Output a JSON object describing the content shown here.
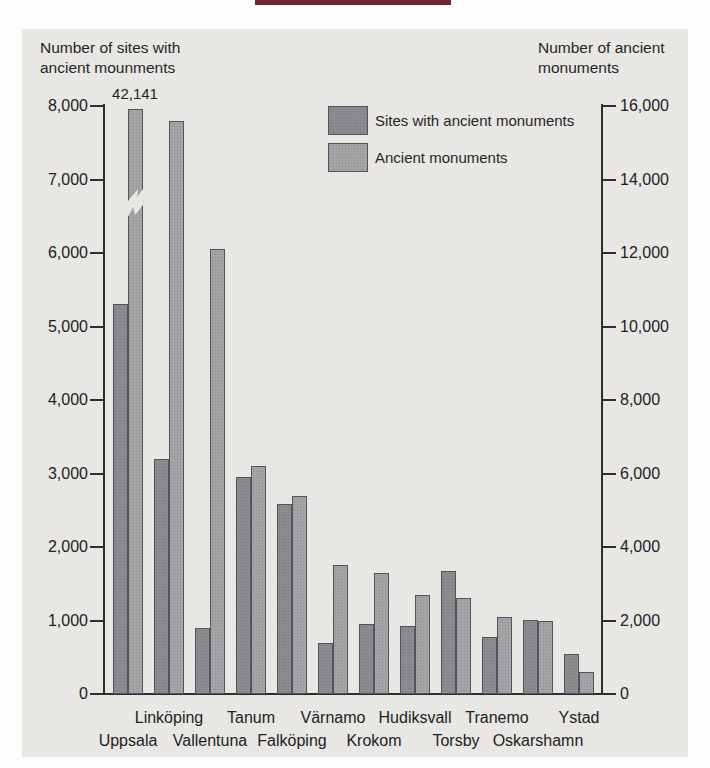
{
  "page": {
    "heading_remnant_color": "#702731",
    "panel_color": "#e8e7e4",
    "text_color": "#262626"
  },
  "titles": {
    "left_line1": "Number of sites with",
    "left_line2": "ancient mounments",
    "right_line1": "Number of ancient",
    "right_line2": "monuments"
  },
  "legend": {
    "items": [
      {
        "label": "Sites with ancient monuments",
        "color": "#8c8b90"
      },
      {
        "label": "Ancient monuments",
        "color": "#a5a3a6"
      }
    ]
  },
  "chart_data": {
    "type": "bar",
    "categories": [
      "Uppsala",
      "Linköping",
      "Vallentuna",
      "Tanum",
      "Falköping",
      "Värnamo",
      "Krokom",
      "Hudiksvall",
      "Torsby",
      "Tranemo",
      "Oskarshamn",
      "Ystad"
    ],
    "series": [
      {
        "name": "Sites with ancient monuments",
        "axis": "left",
        "color": "#8c8b90",
        "values": [
          5300,
          3200,
          900,
          2950,
          2590,
          700,
          950,
          930,
          1670,
          780,
          1010,
          550
        ]
      },
      {
        "name": "Ancient monuments",
        "axis": "right",
        "color": "#a5a3a6",
        "values": [
          42141,
          15600,
          12100,
          6200,
          5400,
          3500,
          3300,
          2700,
          2600,
          2100,
          2000,
          600
        ]
      }
    ],
    "broken_bar": {
      "series_index": 1,
      "category_index": 0,
      "value": 42141,
      "annotation_label": "42,141"
    },
    "left_axis": {
      "label": "Number of sites with ancient mounments",
      "min": 0,
      "max": 8000,
      "tick_step": 1000,
      "tick_labels": [
        "0",
        "1,000",
        "2,000",
        "3,000",
        "4,000",
        "5,000",
        "6,000",
        "7,000",
        "8,000"
      ]
    },
    "right_axis": {
      "label": "Number of ancient monuments",
      "min": 0,
      "max": 16000,
      "tick_step": 2000,
      "tick_labels": [
        "0",
        "2,000",
        "4,000",
        "6,000",
        "8,000",
        "10,000",
        "12,000",
        "14,000",
        "16,000"
      ]
    },
    "x_label_rows": {
      "upper": [
        "Linköping",
        "Tanum",
        "Värnamo",
        "Hudiksvall",
        "Tranemo",
        "Ystad"
      ],
      "lower": [
        "Uppsala",
        "Vallentuna",
        "Falköping",
        "Krokom",
        "Torsby",
        "Oskarshamn"
      ]
    },
    "grid": false,
    "legend_position": "top-center"
  }
}
